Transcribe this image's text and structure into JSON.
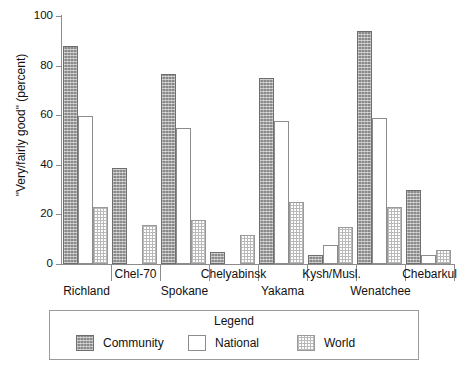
{
  "chart_data": {
    "type": "bar",
    "title": "",
    "xlabel": "",
    "ylabel": "\"Very/fairly good\" (percent)",
    "ylim": [
      0,
      100
    ],
    "yticks": [
      0,
      20,
      40,
      60,
      80,
      100
    ],
    "grid": false,
    "legend": {
      "title": "Legend",
      "position": "bottom",
      "entries": [
        "Community",
        "National",
        "World"
      ]
    },
    "categories": [
      "Richland",
      "Chel-70",
      "Spokane",
      "Chelyabinsk",
      "Yakama",
      "Kysh/Musl.",
      "Wenatchee",
      "Chebarkul"
    ],
    "series": [
      {
        "name": "Community",
        "pattern": "dark-hatched",
        "color": "#8a8a8a",
        "values": [
          87,
          38,
          76,
          4,
          74,
          3,
          93,
          29
        ]
      },
      {
        "name": "National",
        "pattern": "empty",
        "color": "#ffffff",
        "values": [
          59,
          0,
          54,
          0,
          57,
          7,
          58,
          3
        ]
      },
      {
        "name": "World",
        "pattern": "light-checkered",
        "color": "#d8d8d8",
        "values": [
          22,
          15,
          17,
          11,
          24,
          14,
          22,
          5
        ]
      }
    ]
  },
  "axis": {
    "tick_labels": [
      "100",
      "80",
      "60",
      "40",
      "20",
      "0"
    ],
    "y_axis_title": "\"Very/fairly good\" (percent)"
  },
  "category_labels": {
    "row_high": [
      "Chel-70",
      "Chelyabinsk",
      "Kysh/Musl.",
      "Chebarkul"
    ],
    "row_low": [
      "Richland",
      "Spokane",
      "Yakama",
      "Wenatchee"
    ]
  },
  "legend_panel": {
    "title": "Legend",
    "items": [
      {
        "label": "Community",
        "swatch": "dark-hatched-swatch"
      },
      {
        "label": "National",
        "swatch": "empty-swatch"
      },
      {
        "label": "World",
        "swatch": "checkered-swatch"
      }
    ]
  }
}
